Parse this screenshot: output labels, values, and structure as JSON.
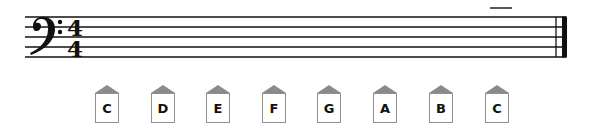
{
  "staff": {
    "clef": "bass-clef",
    "time_signature": {
      "top": "4",
      "bottom": "4"
    },
    "lines": 5,
    "ledger_line_above": true,
    "end_barline": "final-double-bar",
    "colors": {
      "ink": "#111111"
    }
  },
  "note_tiles": [
    {
      "label": "C"
    },
    {
      "label": "D"
    },
    {
      "label": "E"
    },
    {
      "label": "F"
    },
    {
      "label": "G"
    },
    {
      "label": "A"
    },
    {
      "label": "B"
    },
    {
      "label": "C"
    }
  ],
  "colors": {
    "tile_roof": "#8a8a8a",
    "tile_border": "#8f8f8f",
    "tile_text": "#111111"
  }
}
